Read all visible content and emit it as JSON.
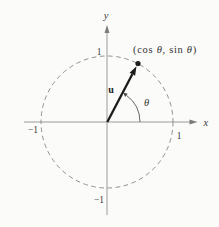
{
  "figure": {
    "kind": "unit-circle-vector-diagram",
    "labels": {
      "x_axis": "x",
      "y_axis": "y",
      "vector": "u",
      "angle": "θ",
      "point_parts": [
        "(cos ",
        "θ",
        ", sin ",
        "θ",
        ")"
      ],
      "ticks": {
        "top": "1",
        "right": "1",
        "bottom": "−1",
        "left": "−1"
      }
    },
    "colors": {
      "background": "#fbfbf9",
      "line": "#8a8a88",
      "text": "#3c3c3a",
      "ink": "#1c1c1a"
    }
  }
}
